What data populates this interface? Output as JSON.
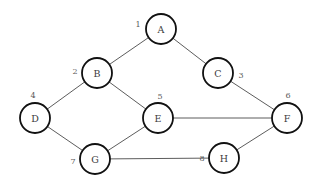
{
  "diagram": {
    "background_color": "#ffffff",
    "node_fill": "#ffffff",
    "node_stroke": "#111111",
    "edge_stroke": "#4a4a4a",
    "label_color": "#5a5a5a",
    "node_radius": 15,
    "nodes": [
      {
        "id": "A",
        "letter": "A",
        "number": "1",
        "cx": 161,
        "cy": 29,
        "num_x": 138,
        "num_y": 24
      },
      {
        "id": "B",
        "letter": "B",
        "number": "2",
        "cx": 97,
        "cy": 73,
        "num_x": 75,
        "num_y": 71
      },
      {
        "id": "C",
        "letter": "C",
        "number": "3",
        "cx": 218,
        "cy": 73,
        "num_x": 241,
        "num_y": 75
      },
      {
        "id": "D",
        "letter": "D",
        "number": "4",
        "cx": 35,
        "cy": 118,
        "num_x": 33,
        "num_y": 95
      },
      {
        "id": "E",
        "letter": "E",
        "number": "5",
        "cx": 158,
        "cy": 118,
        "num_x": 160,
        "num_y": 96
      },
      {
        "id": "F",
        "letter": "F",
        "number": "6",
        "cx": 287,
        "cy": 118,
        "num_x": 288,
        "num_y": 95
      },
      {
        "id": "G",
        "letter": "G",
        "number": "7",
        "cx": 95,
        "cy": 159,
        "num_x": 73,
        "num_y": 161
      },
      {
        "id": "H",
        "letter": "H",
        "number": "8",
        "cx": 224,
        "cy": 158,
        "num_x": 202,
        "num_y": 158
      }
    ],
    "edges": [
      {
        "from": "A",
        "to": "B"
      },
      {
        "from": "A",
        "to": "C"
      },
      {
        "from": "B",
        "to": "D"
      },
      {
        "from": "B",
        "to": "E"
      },
      {
        "from": "C",
        "to": "F"
      },
      {
        "from": "D",
        "to": "G"
      },
      {
        "from": "E",
        "to": "G"
      },
      {
        "from": "E",
        "to": "F"
      },
      {
        "from": "G",
        "to": "H"
      },
      {
        "from": "H",
        "to": "F"
      }
    ]
  }
}
